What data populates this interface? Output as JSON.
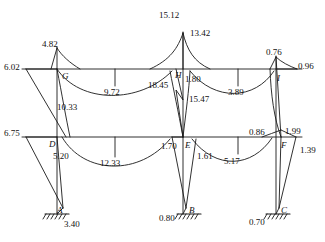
{
  "figure": {
    "type": "bending-moment-diagram",
    "line_color": "#1a1a1a",
    "background": "#ffffff"
  },
  "nodes": [
    {
      "id": "A",
      "label": "A",
      "x": 57,
      "y": 214,
      "kind": "support"
    },
    {
      "id": "B",
      "label": "B",
      "x": 189,
      "y": 214,
      "kind": "support"
    },
    {
      "id": "C",
      "label": "C",
      "x": 281,
      "y": 214,
      "kind": "support"
    },
    {
      "id": "D",
      "label": "D",
      "x": 49,
      "y": 146,
      "kind": "joint"
    },
    {
      "id": "E",
      "label": "E",
      "x": 189,
      "y": 147,
      "kind": "joint"
    },
    {
      "id": "F",
      "label": "F",
      "x": 281,
      "y": 147,
      "kind": "joint"
    },
    {
      "id": "G",
      "label": "G",
      "x": 62,
      "y": 78,
      "kind": "joint"
    },
    {
      "id": "H",
      "label": "H",
      "x": 177,
      "y": 77,
      "kind": "joint"
    },
    {
      "id": "I",
      "label": "I",
      "x": 277,
      "y": 80,
      "kind": "joint"
    }
  ],
  "values": [
    {
      "id": "v-4-82",
      "text": "4.82",
      "x": 42,
      "y": 40,
      "anchor": "upper-left-column-top"
    },
    {
      "id": "v-6-02",
      "text": "6.02",
      "x": 4,
      "y": 63,
      "anchor": "upper-left-beam-end"
    },
    {
      "id": "v-10-33",
      "text": "10.33",
      "x": 57,
      "y": 103,
      "anchor": "left-column-mid"
    },
    {
      "id": "v-9-72",
      "text": "9.72",
      "x": 104,
      "y": 88,
      "anchor": "upper-left-beam-span"
    },
    {
      "id": "v-15-12",
      "text": "15.12",
      "x": 159,
      "y": 11,
      "anchor": "middle-column-top-left"
    },
    {
      "id": "v-13-42",
      "text": "13.42",
      "x": 190,
      "y": 29,
      "anchor": "middle-column-top-right"
    },
    {
      "id": "v-18-45",
      "text": "18.45",
      "x": 148,
      "y": 81,
      "anchor": "joint-H-left"
    },
    {
      "id": "v-1-80",
      "text": "1.80",
      "x": 185,
      "y": 75,
      "anchor": "joint-H-right"
    },
    {
      "id": "v-15-47",
      "text": "15.47",
      "x": 189,
      "y": 95,
      "anchor": "middle-column-upper-storey"
    },
    {
      "id": "v-3-89",
      "text": "3.89",
      "x": 228,
      "y": 88,
      "anchor": "upper-right-beam-span"
    },
    {
      "id": "v-0-76",
      "text": "0.76",
      "x": 266,
      "y": 48,
      "anchor": "right-column-top"
    },
    {
      "id": "v-0-96",
      "text": "0.96",
      "x": 298,
      "y": 62,
      "anchor": "upper-right-beam-end"
    },
    {
      "id": "v-6-75",
      "text": "6.75",
      "x": 4,
      "y": 129,
      "anchor": "lower-left-beam-end"
    },
    {
      "id": "v-5-20",
      "text": "5.20",
      "x": 53,
      "y": 152,
      "anchor": "joint-D"
    },
    {
      "id": "v-12-33",
      "text": "12.33",
      "x": 100,
      "y": 159,
      "anchor": "lower-left-beam-span"
    },
    {
      "id": "v-1-70",
      "text": "1.70",
      "x": 161,
      "y": 142,
      "anchor": "joint-E-left"
    },
    {
      "id": "v-1-61",
      "text": "1.61",
      "x": 197,
      "y": 152,
      "anchor": "joint-E-right"
    },
    {
      "id": "v-5-17",
      "text": "5.17",
      "x": 224,
      "y": 157,
      "anchor": "lower-right-beam-span"
    },
    {
      "id": "v-0-86",
      "text": "0.86",
      "x": 249,
      "y": 128,
      "anchor": "lower-right-beam-near-F"
    },
    {
      "id": "v-1-99",
      "text": "1.99",
      "x": 285,
      "y": 127,
      "anchor": "joint-F-upper"
    },
    {
      "id": "v-1-39",
      "text": "1.39",
      "x": 300,
      "y": 146,
      "anchor": "joint-F-lower"
    },
    {
      "id": "v-3-40",
      "text": "3.40",
      "x": 64,
      "y": 220,
      "anchor": "support-A"
    },
    {
      "id": "v-0-80",
      "text": "0.80",
      "x": 159,
      "y": 214,
      "anchor": "support-B"
    },
    {
      "id": "v-0-70",
      "text": "0.70",
      "x": 249,
      "y": 218,
      "anchor": "support-C"
    }
  ],
  "geometry": {
    "upper_beam_y": 69,
    "lower_beam_y": 137,
    "base_y": 214,
    "columns_x": [
      57,
      183,
      276
    ],
    "beam_left_x": 22,
    "beam_right_x": 302
  }
}
